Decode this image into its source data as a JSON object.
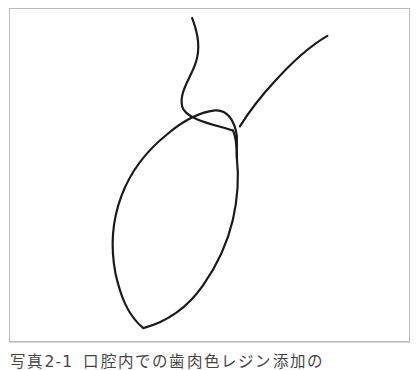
{
  "page": {
    "background_color": "#ffffff",
    "width": 419,
    "height": 370
  },
  "figure": {
    "frame": {
      "border_color": "#b9b9b9",
      "background_color": "#ffffff",
      "x": 9,
      "y": 8,
      "width": 401,
      "height": 334
    },
    "drawing": {
      "type": "hand-drawn-line-diagram",
      "stroke_color": "#1a1a1a",
      "stroke_width": 2.2,
      "description": "Two curved branches meeting at a Y junction above a closed teardrop shaped loop",
      "paths": {
        "upper_left_branch": "M 183 9 C 189 25 192 40 186 56 C 180 72 170 84 173 98 C 176 112 213 118 223 122",
        "upper_right_branch": "M 319 27 C 300 38 281 56 265 74 C 252 88 240 104 231 118",
        "junction_stem": "M 224 122 C 227 128 228 138 228 150",
        "loop": "M 228 150 C 230 168 229 190 224 212 C 218 238 208 258 194 278 C 180 298 160 314 134 321 C 118 308 111 288 106 266 C 101 240 103 212 112 188 C 121 164 138 142 158 126 C 172 114 190 104 206 102 C 218 101 226 112 228 128 Z"
      }
    }
  },
  "caption": {
    "label": "写真2-1",
    "text": "口腔内での歯肉色レジン添加の",
    "clipped": true
  }
}
